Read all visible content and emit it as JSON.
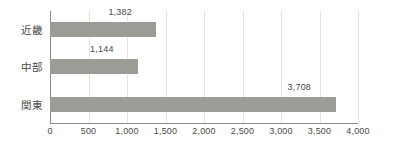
{
  "chart_data": {
    "type": "bar",
    "orientation": "horizontal",
    "title": "",
    "subtitle": "",
    "xlabel": "",
    "ylabel": "",
    "categories": [
      "近畿",
      "中部",
      "関東"
    ],
    "values": [
      1382,
      1144,
      3708
    ],
    "value_labels": [
      "1,382",
      "1,144",
      "3,708"
    ],
    "series": [
      {
        "name": "",
        "values": [
          1382,
          1144,
          3708
        ]
      }
    ],
    "xlim": [
      0,
      4000
    ],
    "xticks": [
      0,
      500,
      1000,
      1500,
      2000,
      2500,
      3000,
      3500,
      4000
    ],
    "xtick_labels": [
      "0",
      "500",
      "1,000",
      "1,500",
      "2,000",
      "2,500",
      "3,000",
      "3,500",
      "4,000"
    ],
    "grid": true,
    "grid_axis": "x",
    "legend": false,
    "legend_position": "none",
    "bar_color": "#9c9c96",
    "grid_color": "#e4e3de",
    "axis_color": "#8a8a83",
    "text_color": "#4a4a46",
    "background_color": "#ffffff"
  }
}
